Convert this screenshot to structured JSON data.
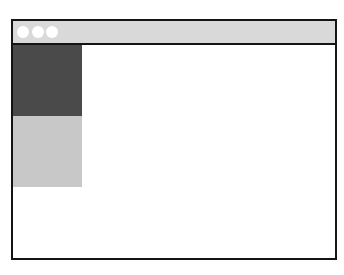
{
  "window": {
    "titlebar": {
      "background": "#d9d9d9",
      "buttons": [
        {
          "name": "close",
          "color": "#ffffff"
        },
        {
          "name": "minimize",
          "color": "#ffffff"
        },
        {
          "name": "maximize",
          "color": "#ffffff"
        }
      ]
    },
    "sidebar": {
      "blocks": [
        {
          "name": "primary-panel",
          "color": "#4a4a4a",
          "height": 71
        },
        {
          "name": "secondary-panel",
          "color": "#c8c8c8",
          "height": 71
        }
      ]
    },
    "content": {
      "background": "#ffffff"
    },
    "border_color": "#141414"
  }
}
